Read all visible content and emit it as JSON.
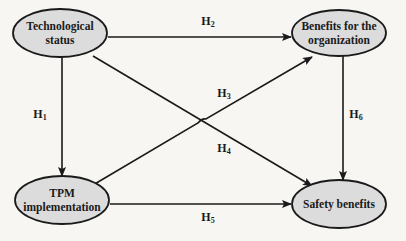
{
  "diagram": {
    "type": "path-model",
    "colors": {
      "background": "#f7f6f2",
      "node_fill": "#dcdcdc",
      "stroke": "#1a1a1a"
    },
    "nodes": [
      {
        "id": "tech",
        "line1": "Technological",
        "line2": "status",
        "cx": 60,
        "cy": 33,
        "rx": 47,
        "ry": 24
      },
      {
        "id": "benefits",
        "line1": "Benefits for the",
        "line2": "organization",
        "cx": 339,
        "cy": 33,
        "rx": 47,
        "ry": 23
      },
      {
        "id": "tpm",
        "line1": "TPM",
        "line2": "implementation",
        "cx": 62,
        "cy": 200,
        "rx": 47,
        "ry": 24
      },
      {
        "id": "safety",
        "line1": "Safety benefits",
        "line2": "",
        "cx": 339,
        "cy": 204,
        "rx": 47,
        "ry": 24
      }
    ],
    "edges": [
      {
        "id": "H1",
        "base": "H",
        "sub": "1",
        "from": "tech",
        "to": "tpm"
      },
      {
        "id": "H2",
        "base": "H",
        "sub": "2",
        "from": "tech",
        "to": "benefits"
      },
      {
        "id": "H3",
        "base": "H",
        "sub": "3",
        "from": "tpm",
        "to": "benefits"
      },
      {
        "id": "H4",
        "base": "H",
        "sub": "4",
        "from": "tech",
        "to": "safety"
      },
      {
        "id": "H5",
        "base": "H",
        "sub": "5",
        "from": "tpm",
        "to": "safety"
      },
      {
        "id": "H6",
        "base": "H",
        "sub": "6",
        "from": "benefits",
        "to": "safety"
      }
    ]
  }
}
